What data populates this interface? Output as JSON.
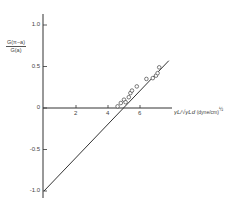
{
  "chart_data": {
    "type": "scatter",
    "title": "",
    "xlabel": "γL/√γLd (dyne/cm)½",
    "ylabel": "G(π−a)/G(a)",
    "xlabel_parts": {
      "main": "γL/√γLd",
      "unit": "(dyne/cm)",
      "exp": "½"
    },
    "ylabel_parts": {
      "numerator": "G(π−a)",
      "denominator": "G(a)"
    },
    "xlim": [
      0,
      8
    ],
    "ylim": [
      -1.0,
      1.0
    ],
    "x_ticks": [
      2,
      4,
      6
    ],
    "x_tick_labels": [
      "2",
      "4",
      "6"
    ],
    "y_ticks": [
      1.0,
      0.5,
      0,
      -0.5,
      -1.0
    ],
    "y_tick_labels": [
      "1.0",
      "0.5",
      "0",
      "-0.5",
      "-1.0"
    ],
    "grid": false,
    "legend": null,
    "series": [
      {
        "name": "measured",
        "marker": "open-circle",
        "x": [
          4.6,
          4.8,
          5.0,
          5.1,
          5.3,
          5.4,
          5.5,
          5.8,
          6.4,
          6.8,
          7.0,
          7.1,
          7.2
        ],
        "y": [
          0.02,
          0.06,
          0.1,
          0.07,
          0.13,
          0.18,
          0.21,
          0.26,
          0.35,
          0.36,
          0.39,
          0.42,
          0.49
        ]
      },
      {
        "name": "fit line",
        "type": "line",
        "x": [
          0,
          7.8
        ],
        "y": [
          -1.0,
          0.57
        ]
      }
    ]
  }
}
